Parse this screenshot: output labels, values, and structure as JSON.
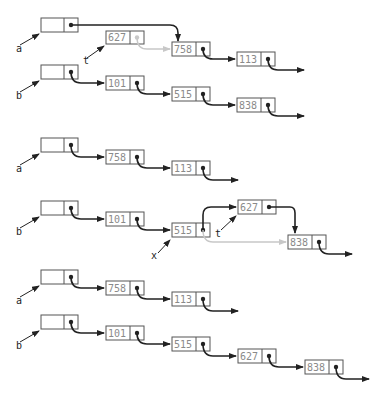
{
  "colors": {
    "ink": "#222222",
    "box": "#555555",
    "ghost": "#c8c8c8",
    "value": "#8a8a8a"
  },
  "diagrams": [
    {
      "id": "d1",
      "heads": [
        {
          "name": "a",
          "x": 41,
          "y": 18,
          "label_x": 20,
          "label_y": 49
        },
        {
          "name": "b",
          "x": 41,
          "y": 65,
          "label_x": 20,
          "label_y": 96
        },
        {
          "name": "t",
          "x": 107,
          "y": 31,
          "label_x": 88,
          "label_y": 62,
          "pointer_only": true
        }
      ],
      "nodes": [
        {
          "id": "n627",
          "value": "627",
          "x": 106,
          "y": 31,
          "ghost_next": true
        },
        {
          "id": "n758",
          "value": "758",
          "x": 172,
          "y": 42
        },
        {
          "id": "n113",
          "value": "113",
          "x": 237,
          "y": 52
        },
        {
          "id": "n101",
          "value": "101",
          "x": 106,
          "y": 76
        },
        {
          "id": "n515",
          "value": "515",
          "x": 172,
          "y": 87
        },
        {
          "id": "n838",
          "value": "838",
          "x": 237,
          "y": 98
        }
      ]
    },
    {
      "id": "d2",
      "heads": [
        {
          "name": "a",
          "x": 41,
          "y": 138,
          "label_x": 20,
          "label_y": 169
        },
        {
          "name": "b",
          "x": 41,
          "y": 201,
          "label_x": 20,
          "label_y": 232
        },
        {
          "name": "x",
          "label_x": 152,
          "label_y": 258,
          "pointer_only": true
        },
        {
          "name": "t",
          "label_x": 215,
          "label_y": 236,
          "pointer_only": true
        }
      ],
      "nodes": [
        {
          "id": "n758b",
          "value": "758",
          "x": 106,
          "y": 150
        },
        {
          "id": "n113b",
          "value": "113",
          "x": 172,
          "y": 161
        },
        {
          "id": "n101b",
          "value": "101",
          "x": 106,
          "y": 212
        },
        {
          "id": "n515b",
          "value": "515",
          "x": 172,
          "y": 223
        },
        {
          "id": "n627b",
          "value": "627",
          "x": 238,
          "y": 200
        },
        {
          "id": "n838b",
          "value": "838",
          "x": 288,
          "y": 235
        }
      ]
    },
    {
      "id": "d3",
      "heads": [
        {
          "name": "a",
          "x": 41,
          "y": 270,
          "label_x": 20,
          "label_y": 301
        },
        {
          "name": "b",
          "x": 41,
          "y": 315,
          "label_x": 20,
          "label_y": 346
        }
      ],
      "nodes": [
        {
          "id": "n758c",
          "value": "758",
          "x": 106,
          "y": 281
        },
        {
          "id": "n113c",
          "value": "113",
          "x": 172,
          "y": 292
        },
        {
          "id": "n101c",
          "value": "101",
          "x": 106,
          "y": 326
        },
        {
          "id": "n515c",
          "value": "515",
          "x": 172,
          "y": 337
        },
        {
          "id": "n627c",
          "value": "627",
          "x": 238,
          "y": 349
        },
        {
          "id": "n838c",
          "value": "838",
          "x": 305,
          "y": 359
        }
      ]
    }
  ],
  "labels": {
    "a1": "a",
    "b1": "b",
    "t1": "t",
    "a2": "a",
    "b2": "b",
    "x2": "x",
    "t2": "t",
    "a3": "a",
    "b3": "b"
  },
  "values": {
    "d1_627": "627",
    "d1_758": "758",
    "d1_113": "113",
    "d1_101": "101",
    "d1_515": "515",
    "d1_838": "838",
    "d2_758": "758",
    "d2_113": "113",
    "d2_101": "101",
    "d2_515": "515",
    "d2_627": "627",
    "d2_838": "838",
    "d3_758": "758",
    "d3_113": "113",
    "d3_101": "101",
    "d3_515": "515",
    "d3_627": "627",
    "d3_838": "838"
  }
}
